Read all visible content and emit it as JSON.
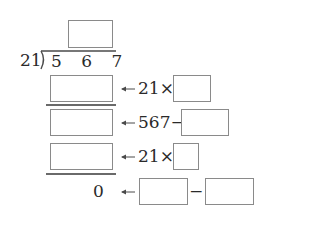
{
  "division": {
    "divisor": "21",
    "dividend": "5 6 7",
    "quotient_box": ""
  },
  "steps": [
    {
      "label": "21×",
      "arrow": "arrow-left"
    },
    {
      "label": "567−",
      "arrow": "arrow-left"
    },
    {
      "label": "21×",
      "arrow": "arrow-left"
    },
    {
      "result": "0",
      "operator": "−",
      "arrow": "arrow-left"
    }
  ],
  "colors": {
    "box_border": "#8a8a8a",
    "line": "#6a6a6a",
    "text": "#2a2a2a"
  }
}
